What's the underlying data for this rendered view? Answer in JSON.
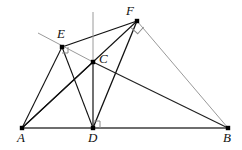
{
  "figure": {
    "type": "geometry-diagram",
    "width": 242,
    "height": 150,
    "background": "#ffffff",
    "colors": {
      "dark_stroke": "#111111",
      "mid_stroke": "#3a3a3a",
      "light_stroke": "#9a9a9a",
      "baseline_stroke": "#6e6e6e",
      "vertex_fill": "#000000",
      "label_color": "#111111"
    },
    "points": [
      {
        "id": "A",
        "label": "A",
        "x": 22,
        "y": 128,
        "label_x": 17,
        "label_y": 131,
        "marker": "square"
      },
      {
        "id": "D",
        "label": "D",
        "x": 93,
        "y": 128,
        "label_x": 88,
        "label_y": 131,
        "marker": "square"
      },
      {
        "id": "B",
        "label": "B",
        "x": 228,
        "y": 128,
        "label_x": 223,
        "label_y": 131,
        "marker": "square"
      },
      {
        "id": "C",
        "label": "C",
        "x": 93,
        "y": 62,
        "label_x": 99,
        "label_y": 52,
        "marker": "square"
      },
      {
        "id": "E",
        "label": "E",
        "x": 62,
        "y": 47,
        "label_x": 57,
        "label_y": 27,
        "marker": "square"
      },
      {
        "id": "F",
        "label": "F",
        "x": 137,
        "y": 21,
        "label_x": 126,
        "label_y": 4,
        "marker": "square"
      }
    ],
    "segments": [
      {
        "name": "segment-AB-baseline",
        "from": "A",
        "to": "B",
        "color": "#6e6e6e",
        "width": 2.1
      },
      {
        "name": "segment-AE",
        "from": "A",
        "to": "E",
        "color": "#111111",
        "width": 1.1
      },
      {
        "name": "segment-AF",
        "from": "A",
        "to": "F",
        "color": "#111111",
        "width": 1.1
      },
      {
        "name": "segment-AC",
        "from": "A",
        "to": "C",
        "color": "#111111",
        "width": 1.1
      },
      {
        "name": "segment-ED",
        "from": "E",
        "to": "D",
        "color": "#111111",
        "width": 1.1
      },
      {
        "name": "segment-EF",
        "from": "E",
        "to": "F",
        "color": "#111111",
        "width": 1.3
      },
      {
        "name": "segment-FD",
        "from": "F",
        "to": "D",
        "color": "#111111",
        "width": 1.3
      },
      {
        "name": "segment-FB",
        "from": "F",
        "to": "B",
        "color": "#9a9a9a",
        "width": 1.0
      },
      {
        "name": "segment-CB",
        "from": "C",
        "to": "B",
        "color": "#222222",
        "width": 1.2
      },
      {
        "name": "segment-CD-altitude",
        "from": "C",
        "to": "D",
        "color": "#111111",
        "width": 1.2
      },
      {
        "name": "segment-vertical-above-C",
        "from": "V_TOP",
        "to": "C",
        "color": "#9a9a9a",
        "width": 1.0
      },
      {
        "name": "segment-EC-extended",
        "from": "E_EXT",
        "to": "C",
        "color": "#9a9a9a",
        "width": 1.0
      }
    ],
    "helper_points": [
      {
        "id": "V_TOP",
        "x": 93,
        "y": 12
      },
      {
        "id": "E_EXT",
        "x": 38,
        "y": 33
      }
    ],
    "right_angle_marks": [
      {
        "name": "right-angle-at-D",
        "vertex": "D",
        "size": 7,
        "rotation": 0,
        "dir_x": 1,
        "dir_y": -1,
        "color": "#8a8a8a"
      },
      {
        "name": "right-angle-at-E",
        "vertex": "E",
        "size": 6,
        "rotation": 0,
        "dir_x": 1,
        "dir_y": 1,
        "color": "#8a8a8a"
      },
      {
        "name": "right-angle-at-F",
        "vertex": "F",
        "size": 9,
        "rotation": 42,
        "dir_x": 1,
        "dir_y": 1,
        "color": "#8a8a8a"
      }
    ],
    "labels": {
      "A": "A",
      "B": "B",
      "C": "C",
      "D": "D",
      "E": "E",
      "F": "F"
    }
  }
}
